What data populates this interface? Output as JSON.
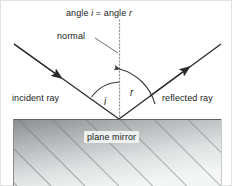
{
  "figure": {
    "width": 232,
    "height": 186,
    "background": "#ffffff",
    "border_color": "#d9d9d9"
  },
  "labels": {
    "title_prefix": "angle ",
    "title_i": "i",
    "title_mid": " = angle ",
    "title_r": "r",
    "title_full": "angle i = angle r",
    "normal": "normal",
    "incident_ray": "incident ray",
    "reflected_ray": "reflected ray",
    "angle_i": "i",
    "angle_r": "r",
    "plane_mirror": "plane mirror"
  },
  "geometry": {
    "vertex_x": 119,
    "vertex_y": 119,
    "normal_top_y": 20,
    "incident_start_x": 14,
    "incident_start_y": 44,
    "reflected_end_x": 221,
    "reflected_end_y": 44,
    "mirror_left": 13,
    "mirror_top": 119,
    "mirror_right": 222,
    "mirror_bottom": 186,
    "arc_i_radius": 40,
    "arc_r_radius": 52
  },
  "colors": {
    "ray_stroke": "#2b2b2b",
    "normal_dotted": "#9a9a9a",
    "arc_stroke": "#3a3a3a",
    "mirror_gradient_dark": "#8d9092",
    "mirror_gradient_light": "#f2f4f4",
    "hatch_stroke": "#6e7173",
    "mirror_edge": "#5e6163",
    "text": "#1a1a1a",
    "label_box_bg": "#eef0f0"
  }
}
